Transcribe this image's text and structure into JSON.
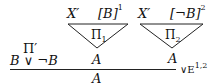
{
  "proof": {
    "left_premise": {
      "derivation_label": "Π′",
      "formula": "B ∨ ¬B"
    },
    "middle_premise": {
      "assumption_context": "X′",
      "discharged_assumption": "[B]",
      "assumption_index": "1",
      "derivation_label": "Π",
      "derivation_sub": "1",
      "conclusion": "A"
    },
    "right_premise": {
      "assumption_context": "X′",
      "discharged_assumption": "[¬B]",
      "assumption_index": "2",
      "derivation_label": "Π",
      "derivation_sub": "2",
      "conclusion": "A"
    },
    "rule": {
      "name": "∨E",
      "indices": "1,2"
    },
    "conclusion": "A"
  }
}
